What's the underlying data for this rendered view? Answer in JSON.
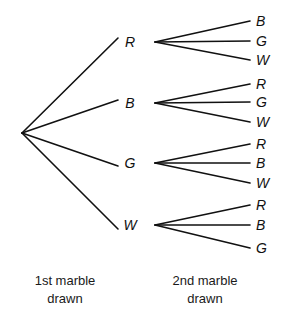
{
  "diagram": {
    "type": "probability-tree",
    "title": "",
    "root": {
      "x": 22,
      "y": 133
    },
    "stage1": {
      "caption_line1": "1st marble",
      "caption_line2": "drawn",
      "caption_center_x": 65,
      "caption_top_y": 272,
      "nodes": [
        {
          "label": "R",
          "x": 130,
          "y": 42,
          "line_end_x": 118,
          "line_end_y": 38
        },
        {
          "label": "B",
          "x": 130,
          "y": 103,
          "line_end_x": 118,
          "line_end_y": 100
        },
        {
          "label": "G",
          "x": 130,
          "y": 163,
          "line_end_x": 118,
          "line_end_y": 166
        },
        {
          "label": "W",
          "x": 130,
          "y": 225,
          "line_end_x": 118,
          "line_end_y": 229
        }
      ]
    },
    "stage2": {
      "caption_line1": "2nd marble",
      "caption_line2": "drawn",
      "caption_center_x": 205,
      "caption_top_y": 272,
      "branch_x": 155,
      "leaf_x": 256,
      "line_end_x": 250,
      "groups": [
        {
          "parent": "R",
          "branch_y": 42,
          "leaves": [
            {
              "label": "B",
              "y": 21
            },
            {
              "label": "G",
              "y": 41
            },
            {
              "label": "W",
              "y": 60
            }
          ]
        },
        {
          "parent": "B",
          "branch_y": 103,
          "leaves": [
            {
              "label": "R",
              "y": 84
            },
            {
              "label": "G",
              "y": 102
            },
            {
              "label": "W",
              "y": 122
            }
          ]
        },
        {
          "parent": "G",
          "branch_y": 163,
          "leaves": [
            {
              "label": "R",
              "y": 144
            },
            {
              "label": "B",
              "y": 163
            },
            {
              "label": "W",
              "y": 183
            }
          ]
        },
        {
          "parent": "W",
          "branch_y": 225,
          "leaves": [
            {
              "label": "R",
              "y": 205
            },
            {
              "label": "B",
              "y": 225
            },
            {
              "label": "G",
              "y": 248
            }
          ]
        }
      ]
    },
    "colors": {
      "background": "#ffffff",
      "line": "#111111",
      "label": "#111111",
      "caption": "#1a1a1a"
    }
  }
}
